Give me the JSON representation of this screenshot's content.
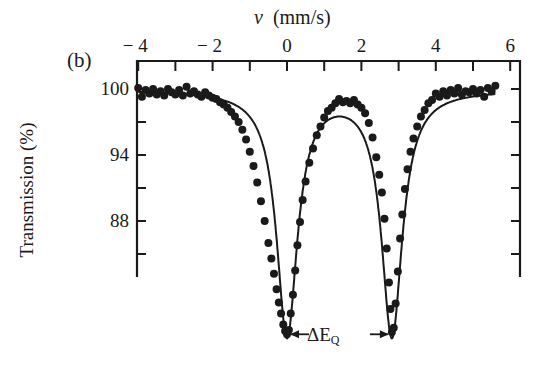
{
  "chart_data": {
    "type": "scatter",
    "title": "",
    "panel_label": "(b)",
    "xlabel_symbol": "v",
    "xlabel_unit": "(mm/s)",
    "ylabel": "Transmission (%)",
    "xlim": [
      -4.2,
      6.2
    ],
    "ylim": [
      76,
      101.2
    ],
    "xaxis_position": "top",
    "x_ticks": [
      -4,
      -2,
      0,
      2,
      4,
      6
    ],
    "x_tick_labels": [
      "− 4",
      "− 2",
      "0",
      "2",
      "4",
      "6"
    ],
    "x_minor_ticks": [
      -3,
      -1,
      1,
      3,
      5
    ],
    "y_ticks": [
      100,
      94,
      88
    ],
    "y_tick_labels": [
      "100",
      "94",
      "88"
    ],
    "y_minor_ticks": [
      97,
      91,
      85
    ],
    "grid": false,
    "annotation": {
      "text": "ΔE",
      "subscript": "Q",
      "from_x": 0.0,
      "to_x": 2.82,
      "y": 77.7
    },
    "series": [
      {
        "name": "measured data",
        "style": "filled-circles",
        "color": "#1a1a1a",
        "x": [
          -4.0,
          -3.9,
          -3.8,
          -3.7,
          -3.6,
          -3.5,
          -3.4,
          -3.3,
          -3.2,
          -3.1,
          -3.0,
          -2.9,
          -2.8,
          -2.7,
          -2.6,
          -2.5,
          -2.4,
          -2.3,
          -2.2,
          -2.1,
          -2.0,
          -1.9,
          -1.8,
          -1.7,
          -1.6,
          -1.5,
          -1.4,
          -1.3,
          -1.2,
          -1.1,
          -1.0,
          -0.9,
          -0.8,
          -0.7,
          -0.6,
          -0.5,
          -0.42,
          -0.35,
          -0.28,
          -0.22,
          -0.16,
          -0.1,
          -0.05,
          0.0,
          0.05,
          0.1,
          0.16,
          0.22,
          0.28,
          0.35,
          0.42,
          0.5,
          0.6,
          0.7,
          0.8,
          0.9,
          1.0,
          1.1,
          1.2,
          1.3,
          1.4,
          1.5,
          1.6,
          1.7,
          1.8,
          1.9,
          2.0,
          2.1,
          2.2,
          2.3,
          2.4,
          2.48,
          2.55,
          2.62,
          2.68,
          2.74,
          2.78,
          2.82,
          2.87,
          2.92,
          2.98,
          3.04,
          3.1,
          3.17,
          3.24,
          3.32,
          3.4,
          3.5,
          3.6,
          3.7,
          3.8,
          3.9,
          4.0,
          4.1,
          4.2,
          4.3,
          4.4,
          4.5,
          4.6,
          4.7,
          4.8,
          4.9,
          5.0,
          5.1,
          5.2,
          5.3,
          5.4,
          5.5,
          5.6
        ],
        "y": [
          100.1,
          99.3,
          99.9,
          99.6,
          100.0,
          99.5,
          99.8,
          99.4,
          100.0,
          99.7,
          99.5,
          99.9,
          99.4,
          100.2,
          99.6,
          99.8,
          99.5,
          99.3,
          99.7,
          99.4,
          99.2,
          99.1,
          98.8,
          98.6,
          98.3,
          97.9,
          97.5,
          97.0,
          96.3,
          95.4,
          94.3,
          93.0,
          91.5,
          89.8,
          88.0,
          86.0,
          84.6,
          83.2,
          81.8,
          80.6,
          79.6,
          78.6,
          78.0,
          77.7,
          78.1,
          79.6,
          81.3,
          83.5,
          85.8,
          87.9,
          89.9,
          91.6,
          93.3,
          94.6,
          95.8,
          96.6,
          97.4,
          98.0,
          98.3,
          98.7,
          99.1,
          98.8,
          98.9,
          98.7,
          99.0,
          98.6,
          98.3,
          97.8,
          96.9,
          95.6,
          93.8,
          92.2,
          90.6,
          88.2,
          85.5,
          82.4,
          80.0,
          77.9,
          78.3,
          80.5,
          83.4,
          86.4,
          88.6,
          90.9,
          92.7,
          94.3,
          95.5,
          96.6,
          97.5,
          98.1,
          98.7,
          99.0,
          99.6,
          99.3,
          99.8,
          99.4,
          99.9,
          99.6,
          100.1,
          99.5,
          99.8,
          99.7,
          100.0,
          99.6,
          99.9,
          99.3,
          100.1,
          99.8,
          100.3
        ]
      },
      {
        "name": "fit",
        "style": "line",
        "color": "#1a1a1a",
        "model": "two Lorentzian doublet",
        "centers": [
          0.0,
          2.82
        ],
        "depth_pct": 22.3,
        "hwhm": 0.34,
        "baseline": 99.95
      }
    ]
  }
}
